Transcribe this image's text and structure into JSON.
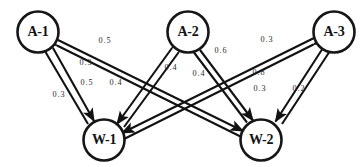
{
  "diagram": {
    "type": "bipartite-weighted-digraph",
    "background_color": "#ffffff",
    "stroke_color": "#121212",
    "nodes": [
      {
        "id": "A-1",
        "label": "A-1",
        "cx": 38,
        "cy": 32,
        "r": 21,
        "group": "agent"
      },
      {
        "id": "A-2",
        "label": "A-2",
        "cx": 188,
        "cy": 32,
        "r": 21,
        "group": "agent"
      },
      {
        "id": "A-3",
        "label": "A-3",
        "cx": 334,
        "cy": 32,
        "r": 21,
        "group": "agent"
      },
      {
        "id": "W-1",
        "label": "W-1",
        "cx": 104,
        "cy": 140,
        "r": 21,
        "group": "work"
      },
      {
        "id": "W-2",
        "label": "W-2",
        "cx": 261,
        "cy": 140,
        "r": 21,
        "group": "work"
      }
    ],
    "edges": [
      {
        "from": "W-1",
        "to": "A-1",
        "weight": "0.5",
        "label_x": 105,
        "label_y": 41,
        "arrows": "both"
      },
      {
        "from": "W-2",
        "to": "A-1",
        "weight": "0.3",
        "label_x": 86,
        "label_y": 63,
        "arrows": "both"
      },
      {
        "from": "A-1",
        "to": "W-1",
        "weight": "0.5",
        "label_x": 87,
        "label_y": 83,
        "arrows": "both"
      },
      {
        "from": "A-2",
        "to": "W-1",
        "weight": "0.4",
        "label_x": 116,
        "label_y": 83,
        "arrows": "both"
      },
      {
        "from": "W-2",
        "to": "A-1",
        "weight": "0.3",
        "label_x": 59,
        "label_y": 95,
        "arrows": "both"
      },
      {
        "from": "W-1",
        "to": "A-2",
        "weight": "0.4",
        "label_x": 171,
        "label_y": 68,
        "arrows": "both"
      },
      {
        "from": "W-2",
        "to": "A-2",
        "weight": "0.4",
        "label_x": 199,
        "label_y": 74,
        "arrows": "both"
      },
      {
        "from": "A-2",
        "to": "W-2",
        "weight": "0.6",
        "label_x": 221,
        "label_y": 51,
        "arrows": "both"
      },
      {
        "from": "W-1",
        "to": "A-3",
        "weight": "0.3",
        "label_x": 267,
        "label_y": 40,
        "arrows": "both"
      },
      {
        "from": "W-1",
        "to": "A-3",
        "weight": "0.8",
        "label_x": 259,
        "label_y": 73,
        "arrows": "both"
      },
      {
        "from": "W-2",
        "to": "A-3",
        "weight": "0.3",
        "label_x": 260,
        "label_y": 89,
        "arrows": "both"
      },
      {
        "from": "A-3",
        "to": "W-2",
        "weight": "0.2",
        "label_x": 299,
        "label_y": 89,
        "arrows": "both"
      }
    ],
    "edge_label_texts": {
      "w1_a1": "0.5",
      "w2_a1_upper": "0.3",
      "a1_w1": "0.5",
      "a2_w1": "0.4",
      "w2_a1_lower": "0.3",
      "w1_a2": "0.4",
      "w2_a2": "0.4",
      "a2_w2": "0.6",
      "w1_a3": "0.3",
      "w1_a3_b": "0.8",
      "w2_a3": "0.3",
      "a3_w2": "0.2"
    },
    "node_labels": {
      "a1": "A-1",
      "a2": "A-2",
      "a3": "A-3",
      "w1": "W-1",
      "w2": "W-2"
    }
  }
}
